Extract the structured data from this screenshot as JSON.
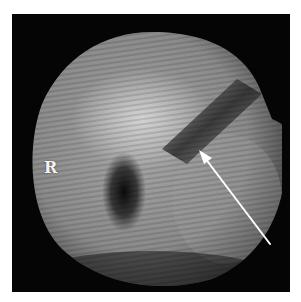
{
  "image": {
    "type": "endoscopic grayscale view",
    "annotation_label": "R",
    "arrow": {
      "tip": [
        199,
        150
      ],
      "tail": [
        270,
        244
      ],
      "color": "#ffffff"
    },
    "colors": {
      "background": "#ffffff",
      "frame": "#050505",
      "tissue_light": "#c8c8c8",
      "tissue_mid": "#8c8c8c",
      "shadow": "#1a1a1a"
    }
  }
}
